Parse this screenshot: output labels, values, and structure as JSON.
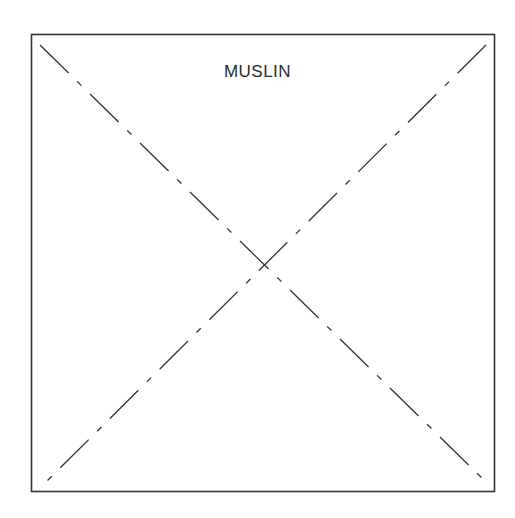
{
  "diagram": {
    "title": "MUSLIN",
    "shape": "square-with-diagonals",
    "line_style": "dash-dot",
    "colors": {
      "stroke": "#333333",
      "background": "#ffffff",
      "text": "#2a2a2a"
    }
  }
}
